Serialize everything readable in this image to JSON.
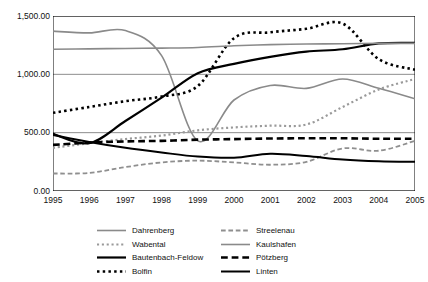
{
  "chart_data": {
    "type": "line",
    "title": "",
    "xlabel": "",
    "ylabel": "",
    "grid": true,
    "legend_position": "bottom",
    "x": [
      1995,
      1996,
      1997,
      1998,
      1999,
      2000,
      2001,
      2002,
      2003,
      2004,
      2005
    ],
    "xlim": [
      1995,
      2005
    ],
    "ylim": [
      0,
      1500
    ],
    "yticks": [
      0,
      500,
      1000,
      1500
    ],
    "ytick_labels": [
      "0.00",
      "500.00",
      "1,000.00",
      "1,500.00"
    ],
    "xtick_labels": [
      "1995",
      "1996",
      "1997",
      "1998",
      "1999",
      "2000",
      "2001",
      "2002",
      "2003",
      "2004",
      "2005"
    ],
    "series": [
      {
        "name": "Dahrenberg",
        "color": "#8a8a8a",
        "style": "solid",
        "width": 1.6,
        "values": [
          1370,
          1355,
          1375,
          1160,
          430,
          780,
          905,
          880,
          960,
          880,
          790
        ]
      },
      {
        "name": "Wabental",
        "color": "#9a9a9a",
        "style": "dotted",
        "width": 2.2,
        "values": [
          370,
          410,
          445,
          475,
          520,
          545,
          560,
          570,
          720,
          870,
          960
        ]
      },
      {
        "name": "Bautenbach-Feldow",
        "color": "#000000",
        "style": "solid",
        "width": 2.2,
        "values": [
          490,
          410,
          600,
          800,
          1010,
          1090,
          1150,
          1195,
          1215,
          1265,
          1270
        ]
      },
      {
        "name": "Bolfin",
        "color": "#000000",
        "style": "dotted",
        "width": 2.6,
        "values": [
          670,
          720,
          770,
          810,
          900,
          1310,
          1360,
          1390,
          1435,
          1130,
          1040
        ]
      },
      {
        "name": "Streelenau",
        "color": "#8f8f8f",
        "style": "dashed",
        "width": 1.8,
        "values": [
          150,
          155,
          205,
          245,
          260,
          245,
          225,
          250,
          365,
          345,
          430
        ]
      },
      {
        "name": "Kaulshafen",
        "color": "#8a8a8a",
        "style": "solid",
        "width": 1.6,
        "values": [
          1215,
          1218,
          1222,
          1225,
          1230,
          1245,
          1255,
          1260,
          1262,
          1265,
          1265
        ]
      },
      {
        "name": "Pötzberg",
        "color": "#000000",
        "style": "dashed",
        "width": 2.6,
        "values": [
          395,
          415,
          425,
          430,
          440,
          445,
          450,
          452,
          452,
          448,
          448
        ]
      },
      {
        "name": "Linten",
        "color": "#000000",
        "style": "solid",
        "width": 2.0,
        "values": [
          480,
          420,
          370,
          330,
          295,
          285,
          320,
          300,
          270,
          255,
          250
        ]
      }
    ]
  },
  "legend": {
    "items": [
      {
        "label": "Dahrenberg",
        "series_index": 0
      },
      {
        "label": "Streelenau",
        "series_index": 4
      },
      {
        "label": "Wabental",
        "series_index": 1
      },
      {
        "label": "Kaulshafen",
        "series_index": 5
      },
      {
        "label": "Bautenbach-Feldow",
        "series_index": 2
      },
      {
        "label": "Pötzberg",
        "series_index": 6
      },
      {
        "label": "Bolfin",
        "series_index": 3
      },
      {
        "label": "Linten",
        "series_index": 7
      }
    ]
  }
}
